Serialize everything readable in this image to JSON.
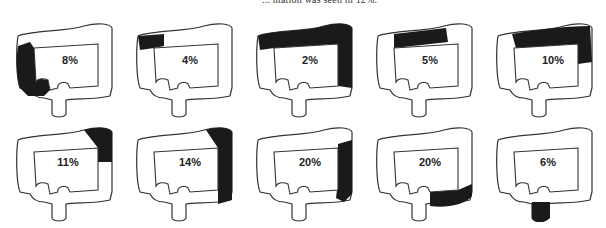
{
  "caption_fragment": "... ntation was seen in 12%.",
  "figure": {
    "panels": [
      {
        "row": 1,
        "col": 1,
        "percent": "8%",
        "shaded_segment": "ascending colon and cecum"
      },
      {
        "row": 1,
        "col": 2,
        "percent": "4%",
        "shaded_segment": "hepatic flexure"
      },
      {
        "row": 1,
        "col": 3,
        "percent": "2%",
        "shaded_segment": "hepatic flexure, transverse colon, splenic flexure and descending colon"
      },
      {
        "row": 1,
        "col": 4,
        "percent": "5%",
        "shaded_segment": "transverse colon"
      },
      {
        "row": 1,
        "col": 5,
        "percent": "10%",
        "shaded_segment": "transverse colon and splenic flexure"
      },
      {
        "row": 2,
        "col": 1,
        "percent": "11%",
        "shaded_segment": "splenic flexure"
      },
      {
        "row": 2,
        "col": 2,
        "percent": "14%",
        "shaded_segment": "splenic flexure and descending colon"
      },
      {
        "row": 2,
        "col": 3,
        "percent": "20%",
        "shaded_segment": "descending colon"
      },
      {
        "row": 2,
        "col": 4,
        "percent": "20%",
        "shaded_segment": "sigmoid colon"
      },
      {
        "row": 2,
        "col": 5,
        "percent": "6%",
        "shaded_segment": "rectum"
      }
    ]
  },
  "colors": {
    "outline": "#333333",
    "shade": "#1a1a1a",
    "background": "#ffffff"
  }
}
